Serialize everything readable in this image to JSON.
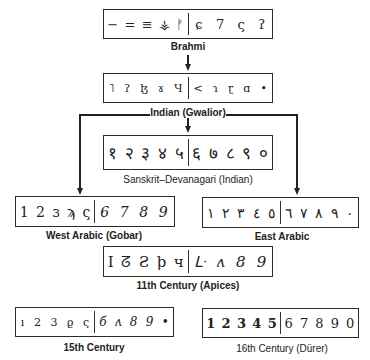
{
  "nodes": {
    "brahmi": {
      "label": "Brahmi",
      "left_glyphs": [
        "−",
        "=",
        "≡",
        "⚶",
        "ᚠ"
      ],
      "right_glyphs": [
        "ɕ",
        "7",
        "ς",
        "ʔ"
      ]
    },
    "gwalior": {
      "label": "Indian (Gwalior)",
      "left_glyphs": [
        "˥",
        "ʔ",
        "ɮ",
        "ɤ",
        "Ч"
      ],
      "right_glyphs": [
        "<",
        "ɿ",
        "ɽ",
        "ɑ",
        "•"
      ]
    },
    "sanskrit": {
      "label": "Sanskrit–Devanagari (Indian)",
      "left_glyphs": [
        "१",
        "२",
        "३",
        "४",
        "५"
      ],
      "right_glyphs": [
        "६",
        "७",
        "८",
        "९",
        "०"
      ]
    },
    "west_arabic": {
      "label": "West Arabic (Gobar)",
      "left_glyphs": [
        "1",
        "2",
        "ɜ",
        "ϡ",
        "ς"
      ],
      "right_glyphs": [
        "6",
        "7",
        "8",
        "9"
      ]
    },
    "east_arabic": {
      "label": "East Arabic",
      "left_glyphs": [
        "١",
        "٢",
        "٣",
        "٤",
        "٥"
      ],
      "right_glyphs": [
        "٦",
        "٧",
        "٨",
        "٩",
        "٠"
      ]
    },
    "apices": {
      "label": "11th Century (Apices)",
      "left_glyphs": [
        "I",
        "ᘔ",
        "Ƨ",
        "ϸ",
        "ч"
      ],
      "right_glyphs": [
        "ᒷ",
        "ʌ",
        "8",
        "9"
      ]
    },
    "fifteenth": {
      "label": "15th Century",
      "left_glyphs": [
        "ı",
        "2",
        "3",
        "ϱ",
        "ς"
      ],
      "right_glyphs": [
        "б",
        "ʌ",
        "8",
        "9",
        "•"
      ]
    },
    "sixteenth": {
      "label": "16th Century (Dürer)",
      "left_glyphs": [
        "1",
        "2",
        "3",
        "4",
        "5"
      ],
      "right_glyphs": [
        "6",
        "7",
        "8",
        "9",
        "0"
      ]
    }
  }
}
